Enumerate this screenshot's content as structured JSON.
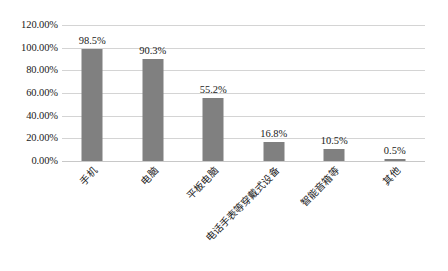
{
  "chart_data": {
    "type": "bar",
    "title": "",
    "subtitle": "",
    "xlabel": "",
    "ylabel": "",
    "categories": [
      "手机",
      "电脑",
      "平板电脑",
      "电话手表等穿戴式设备",
      "智能音箱等",
      "其他"
    ],
    "values": [
      98.5,
      90.3,
      55.2,
      16.8,
      10.5,
      0.5
    ],
    "value_labels": [
      "98.5%",
      "90.3%",
      "55.2%",
      "16.8%",
      "10.5%",
      "0.5%"
    ],
    "ylim": [
      0,
      120
    ],
    "ytick_values": [
      0,
      20,
      40,
      60,
      80,
      100,
      120
    ],
    "ytick_labels": [
      "0.00%",
      "20.00%",
      "40.00%",
      "60.00%",
      "80.00%",
      "100.00%",
      "120.00%"
    ],
    "grid": true,
    "legend": false,
    "legend_position": "none",
    "bar_color": "#808080",
    "gridline_color": "#d4d4d4",
    "background_color": "#ffffff",
    "text_color": "#1a1a1a",
    "xtick_label_rotation": -45
  }
}
